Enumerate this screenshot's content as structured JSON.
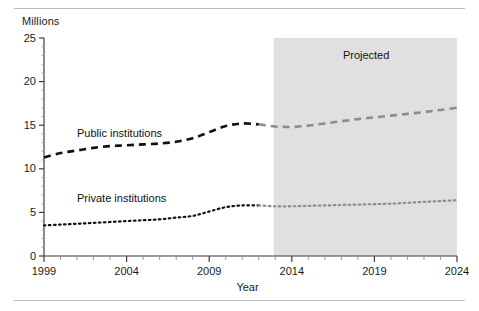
{
  "chart_data": {
    "type": "line",
    "title": "",
    "xlabel": "Year",
    "ylabel": "Millions",
    "ylim": [
      0,
      25
    ],
    "xlim": [
      1999,
      2024
    ],
    "ytick_labels": [
      "0",
      "5",
      "10",
      "15",
      "20",
      "25"
    ],
    "ytick_values": [
      0,
      5,
      10,
      15,
      20,
      25
    ],
    "xtick_labels": [
      "1999",
      "2004",
      "2009",
      "2014",
      "2019",
      "2024"
    ],
    "xtick_values": [
      1999,
      2004,
      2009,
      2014,
      2019,
      2024
    ],
    "minor_xticks_every": 1,
    "grid": false,
    "legend": "inline-labels",
    "annotations": [
      {
        "text": "Projected",
        "x": 2018.5,
        "y": 23.0
      }
    ],
    "shaded_region": {
      "label": "Projected",
      "x_start": 2012.9,
      "x_end": 2024,
      "color": "#e0e0e0"
    },
    "x": [
      1999,
      2000,
      2001,
      2002,
      2003,
      2004,
      2005,
      2006,
      2007,
      2008,
      2009,
      2010,
      2011,
      2012,
      2013,
      2014,
      2015,
      2016,
      2017,
      2018,
      2019,
      2020,
      2021,
      2022,
      2023,
      2024
    ],
    "series": [
      {
        "name": "Public institutions",
        "style": "dashed",
        "color": "#111111",
        "projected_color": "#8c8c8c",
        "label_x": 2001.0,
        "label_y": 14.1,
        "values": [
          11.3,
          11.8,
          12.1,
          12.4,
          12.6,
          12.7,
          12.8,
          12.9,
          13.1,
          13.5,
          14.2,
          14.9,
          15.2,
          15.1,
          14.85,
          14.8,
          14.95,
          15.2,
          15.45,
          15.7,
          15.9,
          16.1,
          16.3,
          16.5,
          16.75,
          17.0
        ]
      },
      {
        "name": "Private institutions",
        "style": "dotted",
        "color": "#111111",
        "projected_color": "#8c8c8c",
        "label_x": 2001.0,
        "label_y": 6.6,
        "values": [
          3.5,
          3.6,
          3.7,
          3.8,
          3.9,
          4.0,
          4.1,
          4.2,
          4.4,
          4.6,
          5.1,
          5.6,
          5.8,
          5.8,
          5.7,
          5.7,
          5.75,
          5.8,
          5.85,
          5.9,
          5.95,
          6.0,
          6.1,
          6.2,
          6.3,
          6.4
        ]
      }
    ]
  },
  "colors": {
    "axis": "#3d3d3d",
    "text": "#1a1a1a",
    "rule": "#b9b9b9",
    "shade": "#e0e0e0",
    "actual_line": "#111111",
    "projected_line": "#8c8c8c"
  }
}
